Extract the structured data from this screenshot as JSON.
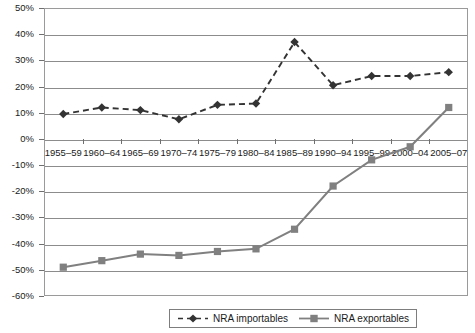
{
  "chart_data": {
    "type": "line",
    "title": "",
    "subtitle": "",
    "xlabel": "",
    "ylabel": "",
    "grid": true,
    "legend_position": "bottom",
    "ylim": [
      -60,
      50
    ],
    "ytick_step": 10,
    "ytick_labels": [
      "50%",
      "40%",
      "30%",
      "20%",
      "10%",
      "0%",
      "-10%",
      "-20%",
      "-30%",
      "-40%",
      "-50%",
      "-60%"
    ],
    "ytick_values": [
      50,
      40,
      30,
      20,
      10,
      0,
      -10,
      -20,
      -30,
      -40,
      -50,
      -60
    ],
    "categories": [
      "1955–59",
      "1960–64",
      "1965–69",
      "1970–74",
      "1975–79",
      "1980–84",
      "1985–89",
      "1990–94",
      "1995–99",
      "2000–04",
      "2005–07"
    ],
    "series": [
      {
        "name": "NRA importables",
        "color": "#333333",
        "line_style": "dashed",
        "marker": "diamond",
        "values": [
          9.5,
          12.0,
          11.0,
          7.5,
          13.0,
          13.5,
          37.0,
          20.5,
          24.0,
          24.0,
          25.5
        ]
      },
      {
        "name": "NRA exportables",
        "color": "#808080",
        "line_style": "solid",
        "marker": "square",
        "values": [
          -49.0,
          -46.5,
          -44.0,
          -44.5,
          -43.0,
          -42.0,
          -34.5,
          -18.0,
          -8.0,
          -3.0,
          12.0
        ]
      }
    ]
  },
  "legend": {
    "items": [
      {
        "label": "NRA importables"
      },
      {
        "label": "NRA exportables"
      }
    ]
  }
}
